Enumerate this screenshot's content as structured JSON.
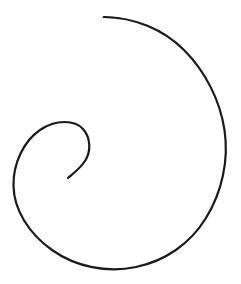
{
  "canvas": {
    "width": 241,
    "height": 284,
    "background_color": "#ffffff",
    "title": "Spiral line drawing"
  },
  "drawing": {
    "name": "spiral-curve",
    "description": "A single continuous hand-drawn spiral line, nautilus-like, opening at the top and coiling inward to the left-of-center.",
    "stroke_color": "#1a1a1a",
    "stroke_width": 2.2,
    "stroke_width_tail": 1.0,
    "fill": "none",
    "linecap": "round",
    "stroke_count": 1,
    "path": "M 104 17 C 134 17.5 163 29 184 50 C 205 71 220 100 224.5 130 C 229 160 222 192 206 218 C 190 244 165 261 136 267 C 107 273 76 267 52 250 C 28 233 14 209 13.5 186 C 13 163 24 141 40 130 C 56 119 75 120 83 129 C 91 138 91 152 85 161 C 79 170 71 175 68 178",
    "key_points": {
      "outer_tail_tip": [
        104,
        17
      ],
      "rightmost": [
        225,
        140
      ],
      "bottommost": [
        108,
        268
      ],
      "leftmost": [
        14,
        192
      ],
      "inner_coil_top": [
        55,
        123
      ],
      "inner_coil_right": [
        90,
        147
      ],
      "inner_tail_tip": [
        68,
        178
      ]
    },
    "winding_direction": "clockwise-inward",
    "turns": 1.35
  }
}
